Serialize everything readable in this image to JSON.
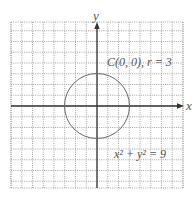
{
  "chart_data": {
    "type": "line",
    "title": "",
    "xlabel": "x",
    "ylabel": "y",
    "xlim": [
      -8,
      8
    ],
    "ylim": [
      -7.5,
      7.5
    ],
    "grid": true,
    "series": [
      {
        "name": "x² + y² = 9",
        "shape": "circle",
        "center": [
          0,
          0
        ],
        "radius": 3
      }
    ],
    "annotations": [
      {
        "text": "C(0, 0), r = 3",
        "x": 4,
        "y": 4
      },
      {
        "text": "x² + y² = 9",
        "x": 4,
        "y": -4.5
      }
    ]
  },
  "axes": {
    "x_label": "x",
    "y_label": "y"
  },
  "labels": {
    "center_radius": "C(0, 0), r = 3",
    "equation": "x² + y² = 9"
  },
  "colors": {
    "grid": "#9a9a9a",
    "axis": "#333333",
    "circle": "#6a6a6a",
    "text": "#555555"
  }
}
